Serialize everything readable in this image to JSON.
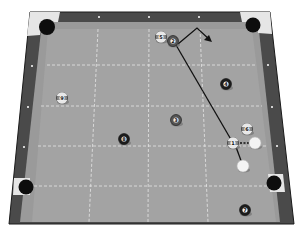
{
  "diagram": {
    "colors": {
      "rail": "#4a4a4a",
      "rail_edge": "#222222",
      "cushion": "#9a9a9a",
      "felt": "#a3a3a3",
      "grid": "#e6e6e6",
      "pocket": "#0d0d0d",
      "pocket_plate": "#e8e8e8",
      "solid_ball": "#1c1c1c",
      "stripe_ball": "#8c8c8c",
      "cue_ball": "#f4f4f4",
      "path": "#111111"
    },
    "balls": [
      {
        "id": "ball-5",
        "label": "5",
        "x": 161,
        "y": 37,
        "type": "stripe"
      },
      {
        "id": "ball-2",
        "label": "2",
        "x": 173,
        "y": 41,
        "type": "dark-stripe"
      },
      {
        "id": "ball-4",
        "label": "4",
        "x": 226,
        "y": 84,
        "type": "solid"
      },
      {
        "id": "ball-9",
        "label": "9",
        "x": 62,
        "y": 98,
        "type": "stripe"
      },
      {
        "id": "ball-3",
        "label": "3",
        "x": 176,
        "y": 120,
        "type": "dark-stripe"
      },
      {
        "id": "ball-8",
        "label": "8",
        "x": 124,
        "y": 139,
        "type": "solid"
      },
      {
        "id": "ball-6",
        "label": "6",
        "x": 247,
        "y": 129,
        "type": "stripe"
      },
      {
        "id": "ball-1",
        "label": "1",
        "x": 233,
        "y": 143,
        "type": "stripe"
      },
      {
        "id": "ball-7",
        "label": "7",
        "x": 245,
        "y": 210,
        "type": "solid"
      }
    ],
    "cue_balls": [
      {
        "id": "cue-ball-contact",
        "x": 255,
        "y": 143
      },
      {
        "id": "cue-ball-start",
        "x": 243,
        "y": 166
      }
    ],
    "diamonds_top": [
      "",
      "",
      ""
    ],
    "diamonds_left": [
      "",
      "",
      ""
    ],
    "diamonds_right": [
      "",
      "",
      ""
    ]
  }
}
